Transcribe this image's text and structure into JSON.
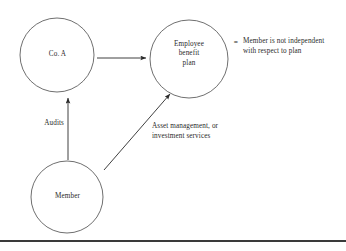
{
  "diagram": {
    "type": "relationship-diagram",
    "nodes": [
      {
        "id": "co-a",
        "label": "Co. A",
        "cx": 57,
        "cy": 55,
        "r": 37
      },
      {
        "id": "plan",
        "label": "Employee\nbenefit\nplan",
        "cx": 189,
        "cy": 59,
        "r": 39
      },
      {
        "id": "member",
        "label": "Member",
        "cx": 67,
        "cy": 197,
        "r": 36
      }
    ],
    "edges": [
      {
        "id": "co-a-to-plan",
        "from": "co-a",
        "to": "plan",
        "label": ""
      },
      {
        "id": "member-to-co-a",
        "from": "member",
        "to": "co-a",
        "label": "Audits"
      },
      {
        "id": "member-to-plan",
        "from": "member",
        "to": "plan",
        "label": "Asset management, or\ninvestment services"
      }
    ],
    "annotation": {
      "equals_symbol": "=",
      "text": "Member is not independent\nwith respect to plan"
    },
    "colors": {
      "stroke": "#4a4a4a",
      "arrow": "#2a2a2a",
      "text": "#2a2a2a",
      "rule": "#3a3a3a",
      "background": "#ffffff"
    }
  }
}
